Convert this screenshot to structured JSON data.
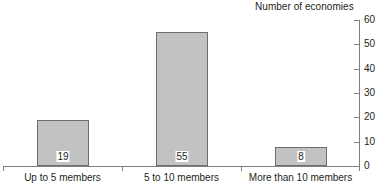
{
  "chart_data": {
    "type": "bar",
    "title": "Number of economies",
    "subtitle": "",
    "xlabel": "",
    "ylabel": "Number of economies",
    "categories": [
      "Up to 5 members",
      "5 to 10 members",
      "More than 10 members"
    ],
    "values": [
      19,
      55,
      8
    ],
    "data_labels": [
      "19",
      "55",
      "8"
    ],
    "ylim": [
      0,
      60
    ],
    "yticks": [
      0,
      10,
      20,
      30,
      40,
      50,
      60
    ],
    "ytick_labels": [
      "0",
      "10",
      "20",
      "30",
      "40",
      "50",
      "60"
    ],
    "grid": false,
    "legend": null,
    "y_axis_position": "right",
    "colors": {
      "bar_fill": "#c2c2c2",
      "bar_border": "#6e6e6e",
      "axis": "#808080",
      "text": "#231f20",
      "background": "#ffffff",
      "label_box": "#ffffff"
    }
  }
}
